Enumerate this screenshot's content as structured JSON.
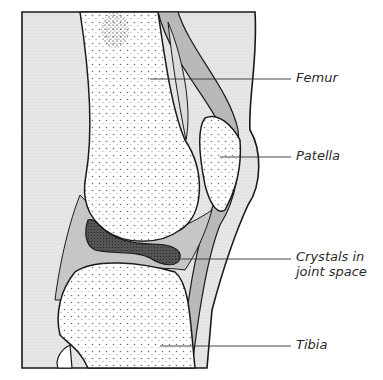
{
  "figure": {
    "colors": {
      "background": "#ffffff",
      "soft_tissue": "#e4e4e4",
      "tendon": "#b8b8b8",
      "joint_fluid": "#c8c8c8",
      "crystal_deposit": "#4e4e4e",
      "bone": "#ffffff",
      "outline": "#1a1a1a",
      "leader_line": "#333333"
    },
    "labels": [
      {
        "id": "femur",
        "text": "Femur",
        "line_start": [
          150,
          79
        ],
        "line_end": [
          291,
          79
        ],
        "text_pos": [
          296,
          70
        ]
      },
      {
        "id": "patella",
        "text": "Patella",
        "line_start": [
          220,
          157
        ],
        "line_end": [
          291,
          157
        ],
        "text_pos": [
          296,
          148
        ]
      },
      {
        "id": "crystals",
        "text": "Crystals in\njoint space",
        "line_start": [
          176,
          259
        ],
        "line_end": [
          291,
          259
        ],
        "text_pos": [
          296,
          249
        ]
      },
      {
        "id": "tibia",
        "text": "Tibia",
        "line_start": [
          160,
          346
        ],
        "line_end": [
          291,
          346
        ],
        "text_pos": [
          296,
          337
        ]
      }
    ]
  }
}
